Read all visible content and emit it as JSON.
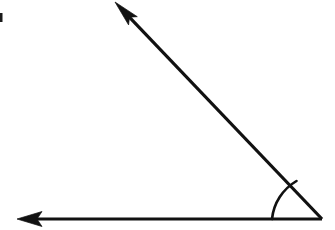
{
  "figure": {
    "name": "angle-diagram",
    "type": "geometric-angle-illustration",
    "background_color": "#ffffff",
    "stroke_color": "#111111",
    "canvas": {
      "width": 335,
      "height": 230
    }
  },
  "geometry": {
    "vertex": {
      "x": 322,
      "y": 219
    },
    "rays": [
      {
        "id": "horizontal-ray",
        "label": "horizontal ray pointing left",
        "from": {
          "x": 322,
          "y": 219
        },
        "to": {
          "x": 17,
          "y": 219
        },
        "stroke_width": 3.2,
        "arrowhead": "barbed"
      },
      {
        "id": "diagonal-ray",
        "label": "diagonal ray pointing upper left",
        "from": {
          "x": 322,
          "y": 219
        },
        "to": {
          "x": 115,
          "y": 2
        },
        "stroke_width": 3.2,
        "arrowhead": "barbed"
      }
    ],
    "angle_arc": {
      "id": "angle-arc",
      "label": "arc marking the interior angle at the vertex",
      "center": {
        "x": 322,
        "y": 219
      },
      "radius": 50,
      "start": {
        "x": 272,
        "y": 219
      },
      "end": {
        "x": 296.5,
        "y": 181
      },
      "stroke_width": 2.6,
      "measure_degrees": 46
    },
    "edge_mark": {
      "id": "edge-artifact",
      "label": "small dark scan artifact at left edge",
      "x": 0,
      "y": 13,
      "width": 2.5,
      "height": 9,
      "color": "#1a1a1a"
    }
  }
}
